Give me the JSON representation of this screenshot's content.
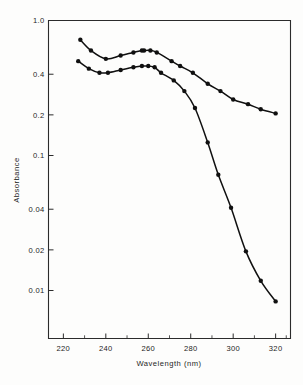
{
  "chart_data": {
    "type": "line",
    "title": "",
    "xlabel": "Wavelength  (nm)",
    "ylabel": "Absorbance",
    "xlim": [
      213,
      327
    ],
    "ylim": [
      0.006,
      1.0
    ],
    "yscale": "log",
    "xscale": "linear",
    "grid": false,
    "legend": null,
    "xticks": [
      220,
      240,
      260,
      280,
      300,
      320
    ],
    "xtick_labels": [
      "220",
      "240",
      "260",
      "280",
      "300",
      "320"
    ],
    "yticks": [
      1.0,
      0.4,
      0.2,
      0.1,
      0.04,
      0.02,
      0.01
    ],
    "ytick_labels": [
      "1.0",
      "0.4",
      "0.2",
      "0.1",
      "0.04",
      "0.02",
      "0.01"
    ],
    "series": [
      {
        "name": "upper-curve",
        "marker": "filled-circle",
        "color": "#101010",
        "x": [
          228,
          233,
          240,
          247,
          253,
          257,
          258,
          261,
          264,
          271,
          275,
          281,
          288,
          294,
          300,
          307,
          313,
          320
        ],
        "y": [
          0.72,
          0.6,
          0.52,
          0.55,
          0.58,
          0.6,
          0.6,
          0.6,
          0.58,
          0.5,
          0.46,
          0.41,
          0.34,
          0.3,
          0.26,
          0.24,
          0.22,
          0.205
        ]
      },
      {
        "name": "lower-curve",
        "marker": "filled-circle",
        "color": "#101010",
        "x": [
          227,
          232,
          237,
          241,
          247,
          253,
          257,
          260,
          263,
          266,
          272,
          277,
          282,
          288,
          293,
          299,
          306,
          313,
          320
        ],
        "y": [
          0.5,
          0.44,
          0.41,
          0.41,
          0.43,
          0.45,
          0.46,
          0.46,
          0.45,
          0.41,
          0.36,
          0.3,
          0.225,
          0.125,
          0.072,
          0.041,
          0.0195,
          0.0118,
          0.0083
        ]
      }
    ]
  },
  "axes": {
    "x_axis_label": "Wavelength  (nm)",
    "y_axis_label": "Absorbance"
  }
}
